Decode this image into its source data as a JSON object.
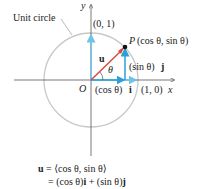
{
  "labels": {
    "unit_circle": "Unit circle",
    "y_axis": "y",
    "x_axis": "x",
    "origin": "O",
    "point_01": "(0, 1)",
    "point_10": "(1, 0)",
    "point_P_name": "P",
    "point_P_coords": "(cos θ, sin θ)",
    "vector_u": "u",
    "angle": "θ",
    "sin_component": "(sin θ)",
    "sin_unit": "j",
    "cos_component": "(cos θ)",
    "cos_unit": "i"
  },
  "equation": {
    "line1_lhs": "u",
    "line1_rhs": " = ⟨cos θ, sin θ⟩",
    "line2_rhs": "= (cos θ)",
    "line2_i": "i",
    "line2_mid": " + (sin θ)",
    "line2_j": "j"
  },
  "colors": {
    "circle": "#c8c8c8",
    "axes": "#555555",
    "unit_vectors": "#6fc3ea",
    "vector_u": "#d9453a",
    "components": "#2aa0d8"
  }
}
